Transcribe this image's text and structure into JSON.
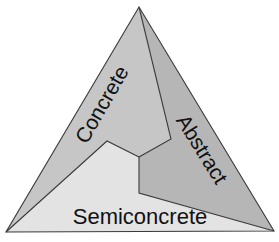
{
  "diagram": {
    "type": "triangle-partition",
    "regions": [
      {
        "id": "concrete",
        "label": "Concrete",
        "fill": "#c6c6c6"
      },
      {
        "id": "abstract",
        "label": "Abstract",
        "fill": "#b6b6b6"
      },
      {
        "id": "semiconcrete",
        "label": "Semiconcrete",
        "fill": "#e3e3e3"
      }
    ],
    "stroke_color": "#3a3a3a"
  }
}
